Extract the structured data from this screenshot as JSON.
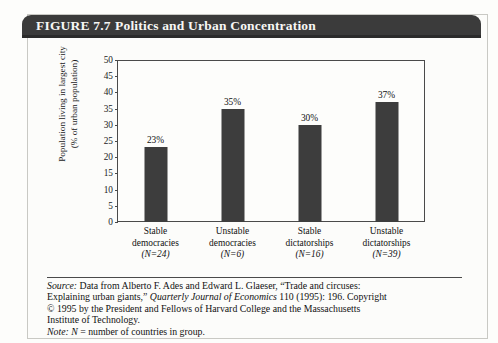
{
  "figure": {
    "number_label": "FIGURE 7.7",
    "title": "Politics and Urban Concentration"
  },
  "chart_data": {
    "type": "bar",
    "title": "Politics and Urban Concentration",
    "xlabel": "",
    "ylabel": "Population living in largest city (% of urban population)",
    "ylabel_line1": "Population living in largest city",
    "ylabel_line2": "(% of urban population)",
    "ylim": [
      0,
      50
    ],
    "ytick_step": 5,
    "yticks": [
      "50",
      "45",
      "40",
      "35",
      "30",
      "25",
      "20",
      "15",
      "10",
      "5",
      "0"
    ],
    "grid": false,
    "legend": "none",
    "categories": [
      "Stable democracies",
      "Unstable democracies",
      "Stable dictatorships",
      "Unstable dictatorships"
    ],
    "values": [
      23,
      35,
      30,
      37
    ],
    "data_labels": [
      "23%",
      "35%",
      "30%",
      "37%"
    ],
    "group_sizes": [
      24,
      6,
      16,
      39
    ],
    "bars": [
      {
        "line1": "Stable",
        "line2": "democracies",
        "n_text": "(N=24)",
        "value": 23,
        "label": "23%"
      },
      {
        "line1": "Unstable",
        "line2": "democracies",
        "n_text": "(N=6)",
        "value": 35,
        "label": "35%"
      },
      {
        "line1": "Stable",
        "line2": "dictatorships",
        "n_text": "(N=16)",
        "value": 30,
        "label": "30%"
      },
      {
        "line1": "Unstable",
        "line2": "dictatorships",
        "n_text": "(N=39)",
        "value": 37,
        "label": "37%"
      }
    ],
    "bar_color": "#3d3d3d"
  },
  "source": {
    "line1_prefix": "Source:",
    "line1": " Data from Alberto F. Ades and Edward L. Glaeser, “Trade and circuses:",
    "line2a": "Explaining urban giants,” ",
    "line2_italic": "Quarterly Journal of Economics",
    "line2b": " 110 (1995): 196. Copyright",
    "line3": "© 1995 by the President and Fellows of Harvard College and the Massachusetts",
    "line4": "Institute of Technology.",
    "note_prefix": "Note:",
    "note_n": " N",
    "note_rest": " = number of countries in group."
  },
  "colors": {
    "banner": "#3b3b3b",
    "bar": "#3d3d3d",
    "page_bg": "#fcfcfa",
    "axis": "#4a4a4a"
  }
}
